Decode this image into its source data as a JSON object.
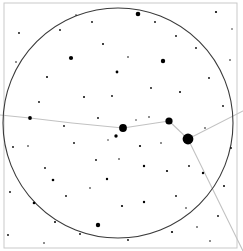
{
  "chart_data": {
    "type": "scatter",
    "title": "",
    "subtitle": "",
    "xlabel": "",
    "ylabel": "",
    "xlim": [
      0,
      243
    ],
    "ylim": [
      0,
      251
    ],
    "grid": false,
    "legend_position": "none",
    "background_color": "#ffffff",
    "star_color": "#000000",
    "horizon_color": "#3a3a3a",
    "constellation_line_color": "#c2c2c2",
    "frame_color": "#c9c9c9",
    "frame": {
      "x": 4,
      "y": 3,
      "width": 233,
      "height": 245
    },
    "horizon_circle": {
      "cx": 118,
      "cy": 123,
      "r": 115,
      "stroke_width": 1.1
    },
    "constellation_lines": [
      {
        "name": "western-chain",
        "points": [
          [
            0,
            115
          ],
          [
            30,
            118
          ],
          [
            72,
            123
          ],
          [
            123,
            128
          ],
          [
            169,
            121
          ],
          [
            188,
            139
          ]
        ]
      },
      {
        "name": "eastern-branch",
        "points": [
          [
            188,
            139
          ],
          [
            243,
            111
          ]
        ]
      },
      {
        "name": "southeastern-branch",
        "points": [
          [
            188,
            139
          ],
          [
            243,
            251
          ]
        ]
      }
    ],
    "named_stars": [
      {
        "name": "alpha-primary",
        "x": 188,
        "y": 139,
        "r": 5.4,
        "magnitude": 0.5
      },
      {
        "name": "beta-node",
        "x": 169,
        "y": 121,
        "r": 3.6,
        "magnitude": 1.8
      },
      {
        "name": "gamma-node",
        "x": 123,
        "y": 128,
        "r": 3.9,
        "magnitude": 1.6
      },
      {
        "name": "delta-chain",
        "x": 30,
        "y": 118,
        "r": 1.9,
        "magnitude": 3.4
      },
      {
        "name": "epsilon-sub",
        "x": 116,
        "y": 136,
        "r": 1.7,
        "magnitude": 3.7
      }
    ],
    "field_stars": [
      {
        "x": 138,
        "y": 14,
        "r": 2.3
      },
      {
        "x": 163,
        "y": 61,
        "r": 2.2
      },
      {
        "x": 71,
        "y": 58,
        "r": 2.1
      },
      {
        "x": 117,
        "y": 72,
        "r": 1.4
      },
      {
        "x": 98,
        "y": 225,
        "r": 2.2
      },
      {
        "x": 216,
        "y": 12,
        "r": 1.1
      },
      {
        "x": 231,
        "y": 148,
        "r": 0.9
      },
      {
        "x": 13,
        "y": 147,
        "r": 0.9
      },
      {
        "x": 45,
        "y": 168,
        "r": 0.9
      },
      {
        "x": 53,
        "y": 180,
        "r": 1.3
      },
      {
        "x": 34,
        "y": 203,
        "r": 1.3
      },
      {
        "x": 74,
        "y": 143,
        "r": 0.9
      },
      {
        "x": 96,
        "y": 160,
        "r": 0.9
      },
      {
        "x": 107,
        "y": 179,
        "r": 1.2
      },
      {
        "x": 144,
        "y": 166,
        "r": 1.2
      },
      {
        "x": 140,
        "y": 146,
        "r": 1.1
      },
      {
        "x": 189,
        "y": 166,
        "r": 0.9
      },
      {
        "x": 167,
        "y": 171,
        "r": 1.1
      },
      {
        "x": 203,
        "y": 173,
        "r": 1.2
      },
      {
        "x": 122,
        "y": 206,
        "r": 1.1
      },
      {
        "x": 144,
        "y": 202,
        "r": 1.2
      },
      {
        "x": 176,
        "y": 196,
        "r": 0.9
      },
      {
        "x": 55,
        "y": 222,
        "r": 1.0
      },
      {
        "x": 80,
        "y": 234,
        "r": 0.9
      },
      {
        "x": 128,
        "y": 240,
        "r": 0.9
      },
      {
        "x": 172,
        "y": 232,
        "r": 1.1
      },
      {
        "x": 218,
        "y": 216,
        "r": 0.9
      },
      {
        "x": 10,
        "y": 192,
        "r": 0.9
      },
      {
        "x": 8,
        "y": 235,
        "r": 0.9
      },
      {
        "x": 19,
        "y": 33,
        "r": 0.9
      },
      {
        "x": 60,
        "y": 30,
        "r": 0.9
      },
      {
        "x": 92,
        "y": 22,
        "r": 0.9
      },
      {
        "x": 103,
        "y": 44,
        "r": 1.0
      },
      {
        "x": 47,
        "y": 77,
        "r": 1.0
      },
      {
        "x": 39,
        "y": 102,
        "r": 0.9
      },
      {
        "x": 84,
        "y": 97,
        "r": 1.0
      },
      {
        "x": 112,
        "y": 96,
        "r": 0.9
      },
      {
        "x": 151,
        "y": 88,
        "r": 0.9
      },
      {
        "x": 180,
        "y": 92,
        "r": 1.0
      },
      {
        "x": 196,
        "y": 48,
        "r": 0.9
      },
      {
        "x": 176,
        "y": 36,
        "r": 0.9
      },
      {
        "x": 155,
        "y": 22,
        "r": 0.9
      },
      {
        "x": 209,
        "y": 78,
        "r": 0.9
      },
      {
        "x": 223,
        "y": 106,
        "r": 0.9
      },
      {
        "x": 224,
        "y": 186,
        "r": 1.0
      },
      {
        "x": 64,
        "y": 126,
        "r": 0.9
      },
      {
        "x": 98,
        "y": 118,
        "r": 0.9
      },
      {
        "x": 149,
        "y": 117,
        "r": 0.8
      },
      {
        "x": 205,
        "y": 128,
        "r": 0.8
      },
      {
        "x": 28,
        "y": 146,
        "r": 0.8
      },
      {
        "x": 66,
        "y": 196,
        "r": 0.9
      },
      {
        "x": 90,
        "y": 188,
        "r": 0.8
      },
      {
        "x": 119,
        "y": 159,
        "r": 0.8
      },
      {
        "x": 161,
        "y": 143,
        "r": 0.8
      },
      {
        "x": 186,
        "y": 208,
        "r": 0.8
      },
      {
        "x": 210,
        "y": 241,
        "r": 0.8
      },
      {
        "x": 44,
        "y": 243,
        "r": 0.8
      },
      {
        "x": 136,
        "y": 120,
        "r": 0.7
      },
      {
        "x": 108,
        "y": 140,
        "r": 0.7
      },
      {
        "x": 230,
        "y": 60,
        "r": 0.8
      },
      {
        "x": 16,
        "y": 62,
        "r": 0.8
      },
      {
        "x": 128,
        "y": 57,
        "r": 0.8
      },
      {
        "x": 76,
        "y": 15,
        "r": 0.7
      },
      {
        "x": 197,
        "y": 227,
        "r": 0.8
      },
      {
        "x": 232,
        "y": 29,
        "r": 0.7
      }
    ]
  }
}
